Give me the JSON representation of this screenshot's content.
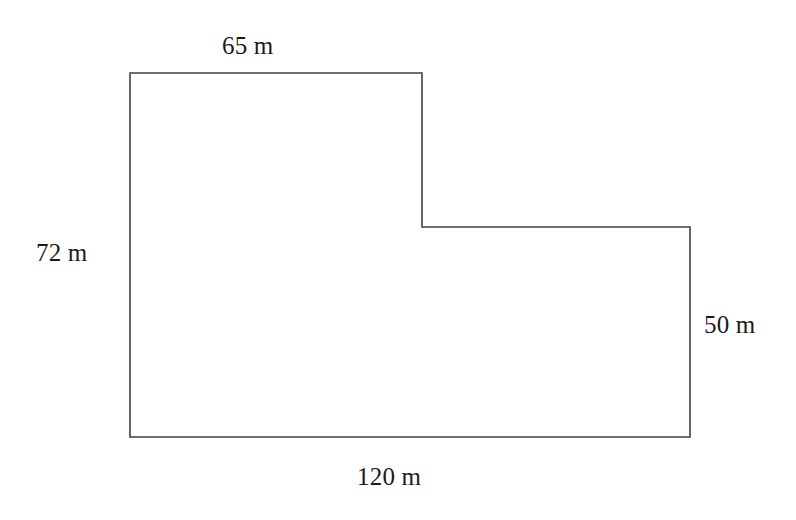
{
  "figure": {
    "name": "l-shaped-polygon",
    "stroke_color": "#404040",
    "fill_color": "#ffffff",
    "background_color": "#ffffff",
    "stroke_width": 1.6,
    "unit": "m",
    "vertices": [
      {
        "id": "top-left",
        "x": 130,
        "y": 73
      },
      {
        "id": "top-right-upper",
        "x": 422,
        "y": 73
      },
      {
        "id": "inner-step",
        "x": 422,
        "y": 227
      },
      {
        "id": "right-upper",
        "x": 690,
        "y": 227
      },
      {
        "id": "bottom-right",
        "x": 690,
        "y": 437
      },
      {
        "id": "bottom-left",
        "x": 130,
        "y": 437
      }
    ],
    "path": "M 130 73 L 422 73 L 422 227 L 690 227 L 690 437 L 130 437 Z"
  },
  "labels": {
    "top": {
      "text": "65 m",
      "value": 65,
      "unit": "m",
      "side": "top-upper-edge"
    },
    "left": {
      "text": "72 m",
      "value": 72,
      "unit": "m",
      "side": "left-edge"
    },
    "right": {
      "text": "50 m",
      "value": 50,
      "unit": "m",
      "side": "right-edge"
    },
    "bottom": {
      "text": "120 m",
      "value": 120,
      "unit": "m",
      "side": "bottom-edge"
    }
  }
}
